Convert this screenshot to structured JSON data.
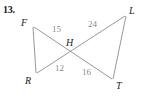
{
  "figure": {
    "problem_number": "13.",
    "stroke_color": "#8c8c8c",
    "label_color": "#232323",
    "measure_color": "#8a8a8a",
    "background": "#ffffff",
    "vertices": [
      {
        "id": "F",
        "label": "F",
        "x": 33,
        "y": 25
      },
      {
        "id": "L",
        "label": "L",
        "x": 126,
        "y": 14
      },
      {
        "id": "H",
        "label": "H",
        "x": 72,
        "y": 52
      },
      {
        "id": "R",
        "label": "R",
        "x": 36,
        "y": 74
      },
      {
        "id": "T",
        "label": "T",
        "x": 113,
        "y": 80
      }
    ],
    "segments": [
      {
        "from": "F",
        "to": "R",
        "label": ""
      },
      {
        "from": "F",
        "to": "T",
        "label": ""
      },
      {
        "from": "L",
        "to": "R",
        "label": ""
      },
      {
        "from": "L",
        "to": "T",
        "label": ""
      }
    ],
    "measures": [
      {
        "id": "FH",
        "value": "15",
        "x": 52,
        "y": 25
      },
      {
        "id": "HL",
        "value": "24",
        "x": 88,
        "y": 20
      },
      {
        "id": "RH",
        "value": "12",
        "x": 55,
        "y": 64
      },
      {
        "id": "HT",
        "value": "16",
        "x": 82,
        "y": 68
      }
    ],
    "vertex_label_positions": {
      "F": {
        "x": 21,
        "y": 18
      },
      "L": {
        "x": 129,
        "y": 6
      },
      "H": {
        "x": 66,
        "y": 38
      },
      "R": {
        "x": 25,
        "y": 76
      },
      "T": {
        "x": 116,
        "y": 81
      }
    }
  }
}
